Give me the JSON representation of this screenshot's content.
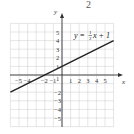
{
  "header": {
    "partial_label": "2"
  },
  "chart_data": {
    "type": "line",
    "title": "",
    "equation": {
      "lhs": "y",
      "eq": "=",
      "frac_num": "1",
      "frac_den": "2",
      "rhs": "x + 1"
    },
    "xlabel": "x",
    "ylabel": "y",
    "xlim": [
      -6,
      6
    ],
    "ylim": [
      -6,
      6
    ],
    "grid": true,
    "x_ticks": [
      "-5",
      "-4",
      "-2",
      "-1",
      "1",
      "2",
      "3",
      "4",
      "5"
    ],
    "y_ticks": [
      "5",
      "4",
      "3",
      "2",
      "1",
      "-2",
      "-3",
      "-4",
      "-5"
    ],
    "series": [
      {
        "name": "y = 1/2 x + 1",
        "x": [
          -6,
          -4,
          -2,
          0,
          2,
          4,
          6
        ],
        "y": [
          -2,
          -1,
          0,
          1,
          2,
          3,
          4
        ]
      }
    ],
    "colors": {
      "line": "#222222",
      "grid": "#cccccc",
      "axis": "#333333"
    }
  }
}
